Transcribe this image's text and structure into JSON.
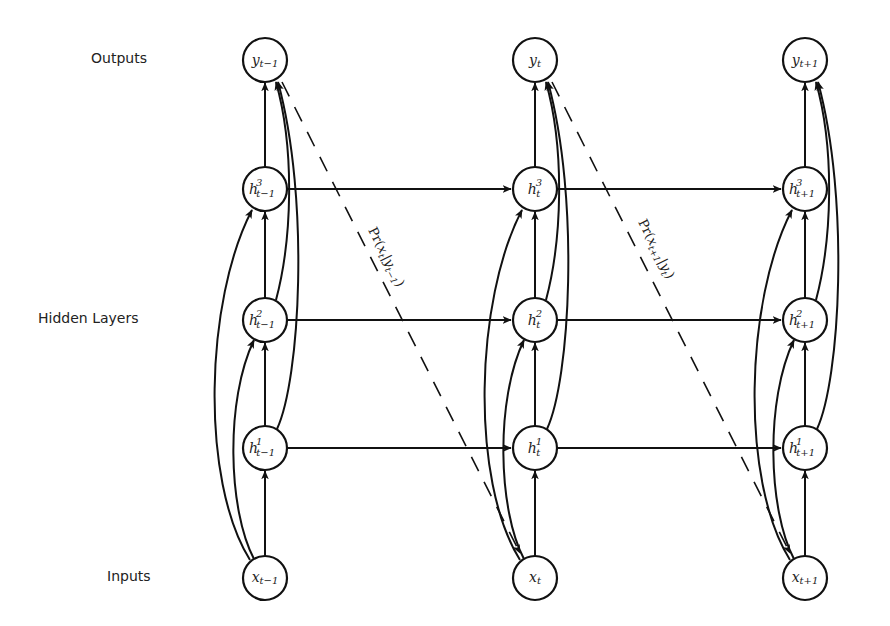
{
  "diagram": {
    "type": "deep-rnn-unrolled",
    "row_labels": {
      "outputs": "Outputs",
      "hidden": "Hidden Layers",
      "inputs": "Inputs"
    },
    "columns": [
      {
        "id": "t-1",
        "output": {
          "base": "y",
          "sub": "t−1",
          "sup": ""
        },
        "h3": {
          "base": "h",
          "sub": "t−1",
          "sup": "3"
        },
        "h2": {
          "base": "h",
          "sub": "t−1",
          "sup": "2"
        },
        "h1": {
          "base": "h",
          "sub": "t−1",
          "sup": "1"
        },
        "input": {
          "base": "x",
          "sub": "t−1",
          "sup": ""
        }
      },
      {
        "id": "t",
        "output": {
          "base": "y",
          "sub": "t",
          "sup": ""
        },
        "h3": {
          "base": "h",
          "sub": "t",
          "sup": "3"
        },
        "h2": {
          "base": "h",
          "sub": "t",
          "sup": "2"
        },
        "h1": {
          "base": "h",
          "sub": "t",
          "sup": "1"
        },
        "input": {
          "base": "x",
          "sub": "t",
          "sup": ""
        }
      },
      {
        "id": "t+1",
        "output": {
          "base": "y",
          "sub": "t+1",
          "sup": ""
        },
        "h3": {
          "base": "h",
          "sub": "t+1",
          "sup": "3"
        },
        "h2": {
          "base": "h",
          "sub": "t+1",
          "sup": "2"
        },
        "h1": {
          "base": "h",
          "sub": "t+1",
          "sup": "1"
        },
        "input": {
          "base": "x",
          "sub": "t+1",
          "sup": ""
        }
      }
    ],
    "prob_edges": [
      {
        "label": "Pr(x_t|y_{t−1})",
        "display": "Pr(",
        "var": "x",
        "var_sub": "t",
        "cond": "y",
        "cond_sub": "t−1",
        "close": ")"
      },
      {
        "label": "Pr(x_{t+1}|y_t)",
        "display": "Pr(",
        "var": "x",
        "var_sub": "t+1",
        "cond": "y",
        "cond_sub": "t",
        "close": ")"
      }
    ],
    "colors": {
      "stroke": "#111111",
      "text": "#222222",
      "background": "#ffffff"
    }
  }
}
